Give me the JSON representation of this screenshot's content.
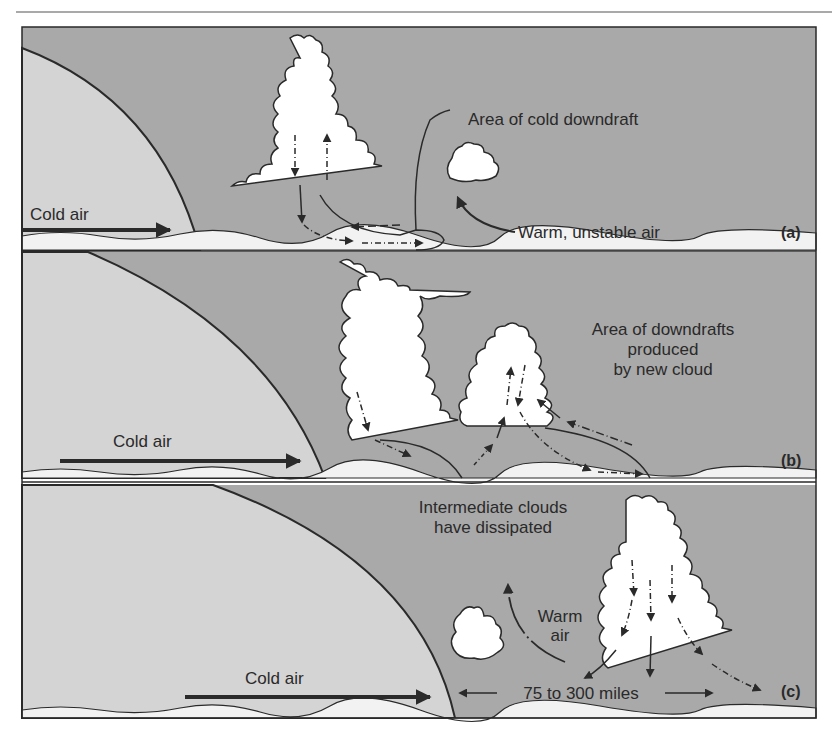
{
  "figure": {
    "colors": {
      "warm_air": "#a9a9a9",
      "cold_air": "#d4d4d4",
      "cloud": "#ffffff",
      "ground": "#f2f2f2",
      "ink": "#2a2a2a"
    },
    "panels": [
      {
        "id": "a",
        "tag": "(a)",
        "cold_air_label": "Cold air",
        "labels": {
          "downdraft": "Area of cold downdraft",
          "warm_air": "Warm, unstable air"
        }
      },
      {
        "id": "b",
        "tag": "(b)",
        "cold_air_label": "Cold air",
        "labels": {
          "line1": "Area of downdrafts",
          "line2": "produced",
          "line3": "by new cloud"
        }
      },
      {
        "id": "c",
        "tag": "(c)",
        "cold_air_label": "Cold air",
        "labels": {
          "dissipated_line1": "Intermediate clouds",
          "dissipated_line2": "have dissipated",
          "warm_line1": "Warm",
          "warm_line2": "air",
          "distance": "75 to 300 miles"
        }
      }
    ]
  }
}
